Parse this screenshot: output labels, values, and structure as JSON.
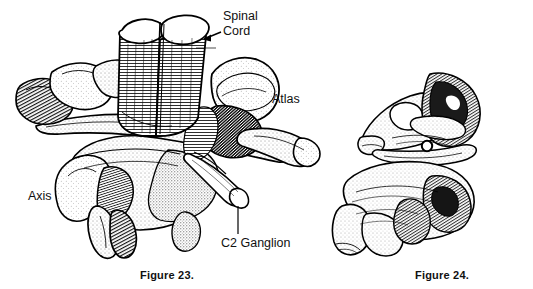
{
  "figure_plate": {
    "background_color": "#ffffff",
    "ink_color": "#000000",
    "subject": "cervical vertebrae atlas and axis anatomical line drawing"
  },
  "figure_23": {
    "caption": "Figure 23.",
    "view": "anterolateral view of atlas and axis with spinal cord and C2 ganglion",
    "labels": {
      "spinal_cord_line1": "Spinal",
      "spinal_cord_line2": "Cord",
      "atlas": "Atlas",
      "axis": "Axis",
      "c2_ganglion": "C2 Ganglion"
    }
  },
  "figure_24": {
    "caption": "Figure 24.",
    "view": "posterolateral view of atlas and axis with circled landmark",
    "marker": {
      "shape": "circle-marker",
      "label": ""
    }
  }
}
